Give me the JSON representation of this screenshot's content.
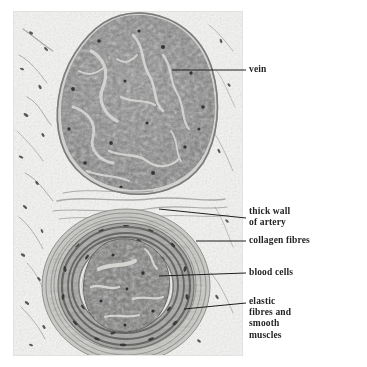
{
  "figure": {
    "kind": "light-micrograph",
    "background_color": "#ffffff",
    "plate_background_color": "#f3f3f2",
    "label_color": "#242424",
    "leader_color": "#1e1e1e"
  },
  "structures": {
    "vein": {
      "name": "vein",
      "fill_color": "#7f7f7f",
      "outline_color": "#5c5c5c"
    },
    "artery": {
      "name": "artery",
      "wall_color": "#8d8d8d",
      "lumen_color": "#f0efed",
      "blood_color": "#6e6e6e"
    },
    "tissue": {
      "name": "surrounding connective tissue",
      "color": "#b9b9b7"
    }
  },
  "labels": [
    {
      "id": "vein",
      "text": "vein",
      "lines": [
        "vein"
      ],
      "target": "large dark blood-filled vessel at top"
    },
    {
      "id": "thick-wall-of-artery",
      "text": "thick wall\nof artery",
      "lines": [
        "thick wall",
        "of artery"
      ],
      "target": "muscular wall of the lower vessel"
    },
    {
      "id": "collagen-fibres",
      "text": "collagen fibres",
      "lines": [
        "collagen fibres"
      ],
      "target": "outer fibrous coat of the artery"
    },
    {
      "id": "blood-cells",
      "text": "blood cells",
      "lines": [
        "blood cells"
      ],
      "target": "dark mass inside the arterial lumen"
    },
    {
      "id": "elastic-fibres-and-smooth-muscles",
      "text": "elastic\nfibres and\nsmooth\nmuscles",
      "lines": [
        "elastic",
        "fibres and",
        "smooth",
        "muscles"
      ],
      "target": "layered wall of the artery"
    }
  ],
  "leader_lines": [
    {
      "id": "leader-vein",
      "x1": 172,
      "y1": 70,
      "x2": 246,
      "y2": 70
    },
    {
      "id": "leader-thick-wall",
      "x1": 159,
      "y1": 209,
      "x2": 246,
      "y2": 218
    },
    {
      "id": "leader-collagen",
      "x1": 196,
      "y1": 241,
      "x2": 246,
      "y2": 241
    },
    {
      "id": "leader-blood-cells",
      "x1": 159,
      "y1": 276,
      "x2": 246,
      "y2": 273
    },
    {
      "id": "leader-elastic",
      "x1": 184,
      "y1": 309,
      "x2": 246,
      "y2": 303
    }
  ]
}
